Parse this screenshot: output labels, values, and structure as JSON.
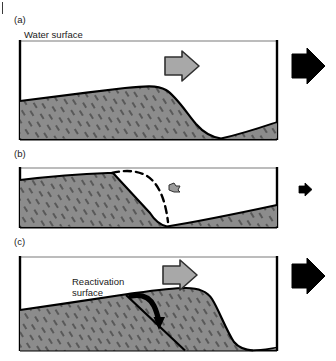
{
  "figure": {
    "type": "geological-cross-section-sequence",
    "colors": {
      "sediment_fill": "#8c8c8c",
      "outline": "#000000",
      "water_surface_line": "#7a7a7a",
      "flow_arrow_fill": "#a8a8a8",
      "flow_arrow_stroke": "#303030",
      "discharge_arrow_fill": "#000000",
      "dashed_profile": "#000000",
      "text": "#1a1a1a",
      "background": "#ffffff"
    }
  },
  "panels": [
    {
      "id": "a",
      "label": "(a)",
      "water_surface_label": "Water surface",
      "stage": "full flow: dune with steep lee face and downstream trough",
      "flow_arrow": "large-grey-block-arrow-right",
      "discharge_arrow": "large-black-block-arrow-right",
      "discharge_magnitude": "high"
    },
    {
      "id": "b",
      "label": "(b)",
      "stage": "reduced flow: dune crest eroded, former profile shown dashed",
      "flow_arrow": "small-grey-block-arrow-right",
      "discharge_arrow": "small-black-block-arrow-right",
      "discharge_magnitude": "low",
      "dashed_profile_note": "former dune profile"
    },
    {
      "id": "c",
      "label": "(c)",
      "stage": "renewed flow: dune migrates again, burying the erosion surface",
      "annotation": "Reactivation\nsurface",
      "annotation_line1": "Reactivation",
      "annotation_line2": "surface",
      "pointer": "curved-black-arrow",
      "flow_arrow": "large-grey-block-arrow-right",
      "discharge_arrow": "large-black-block-arrow-right",
      "discharge_magnitude": "high"
    }
  ]
}
